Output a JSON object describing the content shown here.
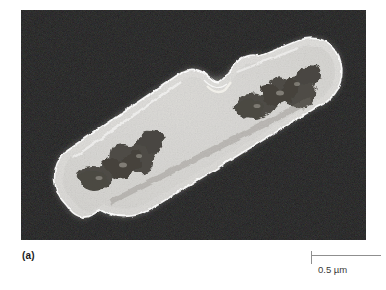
{
  "figure": {
    "panel_letter": "(a)",
    "domain_subject": "electron micrograph of a dividing rod-shaped bacterium",
    "background_color": "#ffffff"
  },
  "micrograph": {
    "alt_text": "Transmission electron micrograph of a bacillus undergoing binary fission, showing two daughter cells joined at a central septum, each containing a dark nucleoid within a granular cytoplasm",
    "panel_background_color": "#050505",
    "cell_wall_color": "#f2f0ec",
    "cytoplasm_color": "#b9b6ae",
    "nucleoid_color": "#3a3832",
    "cell_orientation_degrees": -31,
    "structures": [
      {
        "name": "daughter-cell-lower-left",
        "label": "lower-left daughter cell"
      },
      {
        "name": "daughter-cell-upper-right",
        "label": "upper-right daughter cell"
      },
      {
        "name": "septum",
        "label": "division septum constriction"
      },
      {
        "name": "nucleoid-lower-left",
        "label": "nucleoid of lower-left cell"
      },
      {
        "name": "nucleoid-upper-right",
        "label": "nucleoid of upper-right cell"
      }
    ]
  },
  "scale_bar": {
    "label": "0.5 µm",
    "value": 0.5,
    "unit": "µm",
    "line_color": "#8f8f8f",
    "has_left_tick": true,
    "has_right_tick": false
  }
}
